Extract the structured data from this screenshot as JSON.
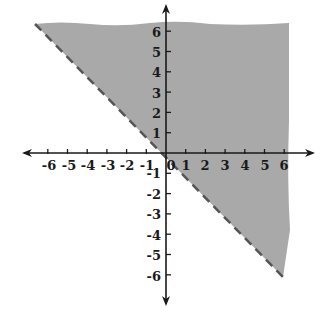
{
  "chart_data": {
    "type": "area",
    "title": "",
    "boundary": {
      "equation": "y = -x",
      "style": "dashed",
      "from": [
        -6.5,
        6.5
      ],
      "to": [
        6,
        -6
      ]
    },
    "shaded_region": "above the line y = -x",
    "inequality": "y > -x",
    "xlim": [
      -7,
      7
    ],
    "ylim": [
      -7,
      7
    ],
    "x_ticks": [
      "-6",
      "-5",
      "-4",
      "-3",
      "-2",
      "-1",
      "0",
      "1",
      "2",
      "3",
      "4",
      "5",
      "6"
    ],
    "y_ticks": [
      "6",
      "5",
      "4",
      "3",
      "2",
      "1",
      "-1",
      "-2",
      "-3",
      "-4",
      "-5",
      "-6"
    ],
    "grid": false,
    "legend": null
  },
  "colors": {
    "shade": "#a9a9a9",
    "axis": "#1a1a1a",
    "boundary": "#555555"
  },
  "labels": {
    "x": [
      "-6",
      "-5",
      "-4",
      "-3",
      "-2",
      "-1",
      "0",
      "1",
      "2",
      "3",
      "4",
      "5",
      "6"
    ],
    "y_pos": [
      "1",
      "2",
      "3",
      "4",
      "5",
      "6"
    ],
    "y_neg": [
      "-1",
      "-2",
      "-3",
      "-4",
      "-5",
      "-6"
    ]
  }
}
